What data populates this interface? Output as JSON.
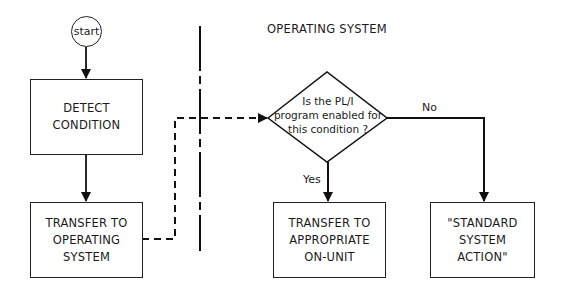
{
  "diagram": {
    "region_label": "OPERATING SYSTEM",
    "nodes": {
      "start": {
        "label": "start",
        "shape": "circle"
      },
      "detect": {
        "label": "DETECT\nCONDITION",
        "shape": "rect"
      },
      "transfer_os": {
        "label": "TRANSFER TO\nOPERATING\nSYSTEM",
        "shape": "rect"
      },
      "decision": {
        "label": "Is the PL/I\nprogram enabled for\nthis condition ?",
        "shape": "diamond"
      },
      "on_unit": {
        "label": "TRANSFER TO\nAPPROPRIATE\nON-UNIT",
        "shape": "rect"
      },
      "standard": {
        "label": "\"STANDARD\nSYSTEM\nACTION\"",
        "shape": "rect"
      }
    },
    "edges": [
      {
        "from": "start",
        "to": "detect",
        "style": "solid"
      },
      {
        "from": "detect",
        "to": "transfer_os",
        "style": "solid"
      },
      {
        "from": "transfer_os",
        "to": "decision",
        "style": "dashed"
      },
      {
        "from": "decision",
        "to": "on_unit",
        "style": "solid",
        "label": "Yes"
      },
      {
        "from": "decision",
        "to": "standard",
        "style": "solid",
        "label": "No"
      }
    ],
    "edge_labels": {
      "yes": "Yes",
      "no": "No"
    },
    "divider": {
      "style": "dash-dot",
      "meaning": "program / operating system boundary"
    }
  }
}
